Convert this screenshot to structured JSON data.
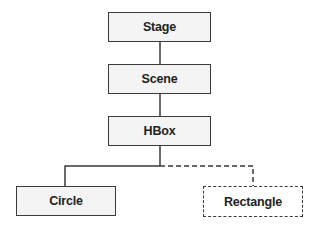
{
  "diagram": {
    "type": "scene-graph-tree",
    "nodes": [
      {
        "id": "stage",
        "label": "Stage",
        "style": "solid"
      },
      {
        "id": "scene",
        "label": "Scene",
        "style": "solid"
      },
      {
        "id": "hbox",
        "label": "HBox",
        "style": "solid"
      },
      {
        "id": "circle",
        "label": "Circle",
        "style": "solid"
      },
      {
        "id": "rectangle",
        "label": "Rectangle",
        "style": "dashed"
      }
    ],
    "edges": [
      {
        "from": "stage",
        "to": "scene",
        "style": "solid"
      },
      {
        "from": "scene",
        "to": "hbox",
        "style": "solid"
      },
      {
        "from": "hbox",
        "to": "circle",
        "style": "solid"
      },
      {
        "from": "hbox",
        "to": "rectangle",
        "style": "dashed"
      }
    ],
    "colors": {
      "border": "#3a3a3a",
      "fill": "#f4f4f4",
      "text": "#222222"
    }
  }
}
